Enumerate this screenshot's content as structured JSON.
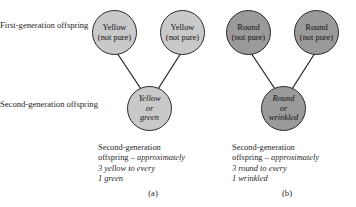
{
  "figure": {
    "row_labels": {
      "first_generation": "First-generation offspring",
      "second_generation": "Second-generation offspring"
    },
    "panels": [
      {
        "letter": "(a)",
        "trait": "yellow-green",
        "parent1": {
          "line1": "Yellow",
          "line2": "(not pure)"
        },
        "parent2": {
          "line1": "Yellow",
          "line2": "(not pure)"
        },
        "offspring": {
          "line1": "Yellow",
          "line2": "or",
          "line3": "green"
        },
        "caption": {
          "line1": "Second-generation",
          "line2_plain": "offspring – ",
          "line2_italic": "approximately",
          "line3": "3 yellow to every",
          "line4": "1 green"
        }
      },
      {
        "letter": "(b)",
        "trait": "round-wrinkled",
        "parent1": {
          "line1": "Round",
          "line2": "(not pure)"
        },
        "parent2": {
          "line1": "Round",
          "line2": "(not pure)"
        },
        "offspring": {
          "line1": "Round",
          "line2": "or",
          "line3": "wrinkled"
        },
        "caption": {
          "line1": "Second-generation",
          "line2_plain": "offspring – ",
          "line2_italic": "approximately",
          "line3": "3 round to every",
          "line4": "1 wrinkled"
        }
      }
    ],
    "colors": {
      "circle_light_fill": "#c9c9c9",
      "circle_dark_fill": "#9a9a9a",
      "circle_outline": "#2b2b2b",
      "connector_line": "#2b2b2b",
      "text": "#1f1f1f",
      "background": "#ffffff"
    }
  }
}
